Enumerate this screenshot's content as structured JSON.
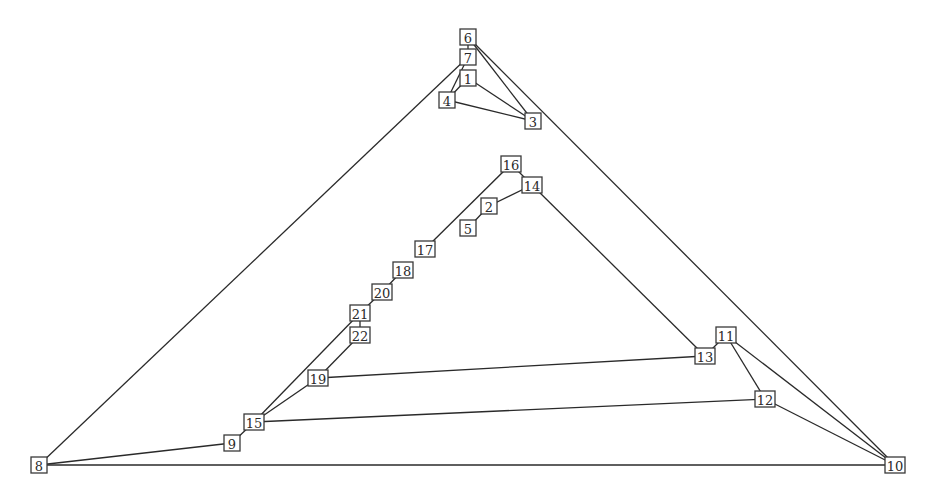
{
  "diagram": {
    "type": "graph",
    "nodes": [
      {
        "id": "6",
        "label": "6",
        "x": 468,
        "y": 37
      },
      {
        "id": "7",
        "label": "7",
        "x": 468,
        "y": 57
      },
      {
        "id": "1",
        "label": "1",
        "x": 468,
        "y": 78
      },
      {
        "id": "4",
        "label": "4",
        "x": 447,
        "y": 100
      },
      {
        "id": "3",
        "label": "3",
        "x": 533,
        "y": 121
      },
      {
        "id": "16",
        "label": "16",
        "x": 511,
        "y": 164
      },
      {
        "id": "14",
        "label": "14",
        "x": 532,
        "y": 185
      },
      {
        "id": "2",
        "label": "2",
        "x": 489,
        "y": 206
      },
      {
        "id": "5",
        "label": "5",
        "x": 468,
        "y": 228
      },
      {
        "id": "17",
        "label": "17",
        "x": 425,
        "y": 249
      },
      {
        "id": "18",
        "label": "18",
        "x": 403,
        "y": 270
      },
      {
        "id": "20",
        "label": "20",
        "x": 382,
        "y": 292
      },
      {
        "id": "21",
        "label": "21",
        "x": 360,
        "y": 313
      },
      {
        "id": "22",
        "label": "22",
        "x": 360,
        "y": 335
      },
      {
        "id": "11",
        "label": "11",
        "x": 726,
        "y": 335
      },
      {
        "id": "13",
        "label": "13",
        "x": 705,
        "y": 356
      },
      {
        "id": "19",
        "label": "19",
        "x": 318,
        "y": 378
      },
      {
        "id": "12",
        "label": "12",
        "x": 765,
        "y": 399
      },
      {
        "id": "15",
        "label": "15",
        "x": 254,
        "y": 422
      },
      {
        "id": "9",
        "label": "9",
        "x": 232,
        "y": 443
      },
      {
        "id": "8",
        "label": "8",
        "x": 39,
        "y": 465
      },
      {
        "id": "10",
        "label": "10",
        "x": 895,
        "y": 465
      }
    ],
    "edges": [
      {
        "from": "6",
        "to": "7"
      },
      {
        "from": "6",
        "to": "3"
      },
      {
        "from": "6",
        "to": "10"
      },
      {
        "from": "7",
        "to": "8"
      },
      {
        "from": "7",
        "to": "4"
      },
      {
        "from": "1",
        "to": "4"
      },
      {
        "from": "1",
        "to": "3"
      },
      {
        "from": "4",
        "to": "3"
      },
      {
        "from": "16",
        "to": "14"
      },
      {
        "from": "16",
        "to": "17"
      },
      {
        "from": "14",
        "to": "2"
      },
      {
        "from": "14",
        "to": "13"
      },
      {
        "from": "2",
        "to": "5"
      },
      {
        "from": "18",
        "to": "20"
      },
      {
        "from": "20",
        "to": "21"
      },
      {
        "from": "21",
        "to": "22"
      },
      {
        "from": "21",
        "to": "15"
      },
      {
        "from": "22",
        "to": "19"
      },
      {
        "from": "19",
        "to": "15"
      },
      {
        "from": "19",
        "to": "13"
      },
      {
        "from": "13",
        "to": "11"
      },
      {
        "from": "11",
        "to": "12"
      },
      {
        "from": "11",
        "to": "10"
      },
      {
        "from": "12",
        "to": "10"
      },
      {
        "from": "15",
        "to": "12"
      },
      {
        "from": "15",
        "to": "9"
      },
      {
        "from": "9",
        "to": "8"
      },
      {
        "from": "8",
        "to": "10"
      }
    ],
    "colors": {
      "edge": "#2a2a2a",
      "node_border": "#3a3a3a",
      "node_fill": "#ffffff",
      "label": "#2a2a2a",
      "background": "#ffffff"
    }
  }
}
